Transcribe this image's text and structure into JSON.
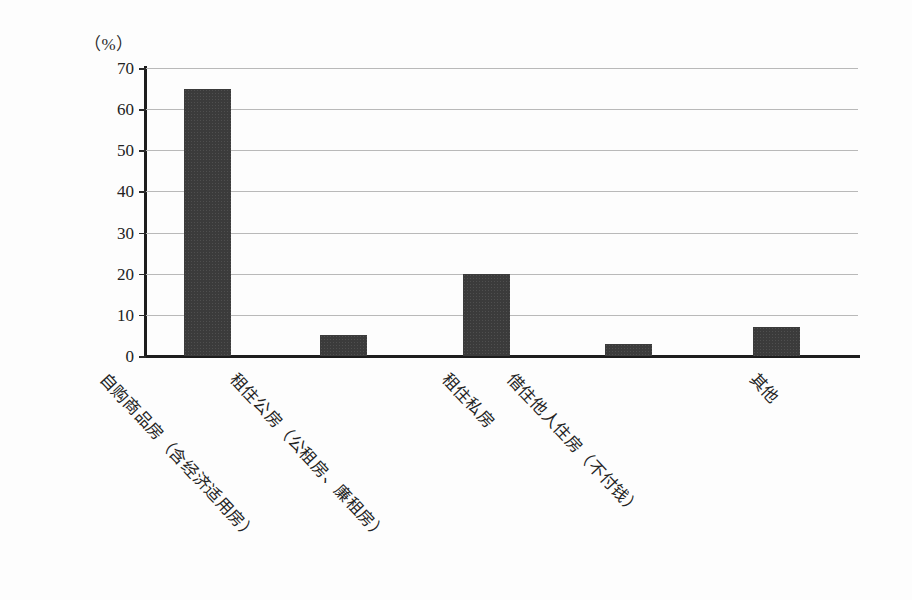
{
  "chart_data": {
    "type": "bar",
    "title": "",
    "subtitle": "",
    "xlabel": "",
    "ylabel": "",
    "unit_label": "（%）",
    "categories": [
      "自购商品房（含经济适用房）",
      "租住公房（公租房、廉租房）",
      "租住私房",
      "借住他人住房（不付钱）",
      "其他"
    ],
    "values": [
      65,
      5,
      20,
      3,
      7
    ],
    "ylim": [
      0,
      70
    ],
    "ytick_step": 10,
    "yticks": [
      70,
      60,
      50,
      40,
      30,
      20,
      10,
      0
    ],
    "grid": true,
    "grid_axis": "y",
    "legend": null,
    "legend_position": "none",
    "bar_color": "#3b3b3b",
    "axis_color": "#1d1d1d",
    "grid_color": "#b9b9b9",
    "background_color": "#fdfdfd",
    "annotations": []
  },
  "figure": {
    "bar_label_rotation_deg": 47
  }
}
